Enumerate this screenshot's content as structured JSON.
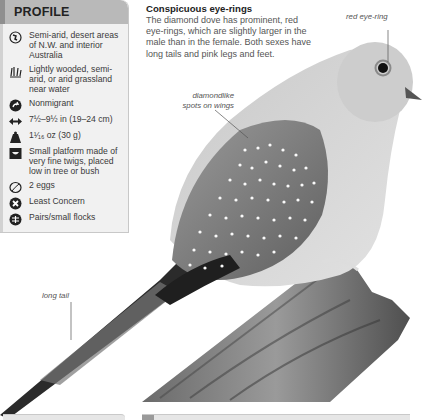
{
  "profile": {
    "title": "PROFILE",
    "items": [
      {
        "icon": "globe-icon",
        "text": "Semi-arid, desert areas of N.W. and interior Australia"
      },
      {
        "icon": "grassland-habitat-icon",
        "text": "Lightly wooded, semi-arid, or arid grassland near water"
      },
      {
        "icon": "migration-icon",
        "text": "Nonmigrant"
      },
      {
        "icon": "wingspan-length-icon",
        "text": "7½–9½ in (19–24 cm)"
      },
      {
        "icon": "weight-icon",
        "text": "1¹⁄₁₆ oz (30 g)"
      },
      {
        "icon": "nest-icon",
        "text": "Small platform made of very fine twigs, placed low in tree or bush"
      },
      {
        "icon": "eggs-icon",
        "text": "2 eggs"
      },
      {
        "icon": "conservation-status-icon",
        "text": "Least Concern"
      },
      {
        "icon": "social-grouping-icon",
        "text": "Pairs/small flocks"
      }
    ]
  },
  "caption": {
    "heading": "Conspicuous eye-rings",
    "body": "The diamond dove has prominent, red eye-rings, which are slightly larger in the male than in the female. Both sexes have long tails and pink legs and feet."
  },
  "annotations": {
    "eye_ring": "red eye-ring",
    "wing_spots_line1": "diamondlike",
    "wing_spots_line2": "spots on wings",
    "tail": "long tail"
  },
  "colors": {
    "header_bg": "#b9b9b9",
    "panel_bg": "#f1f1f1",
    "accent_edge": "#8f8f8f"
  }
}
